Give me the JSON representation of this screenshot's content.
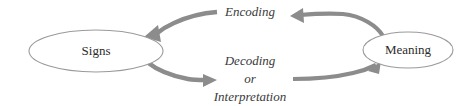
{
  "diagram": {
    "type": "cycle-diagram",
    "background_color": "#ffffff",
    "nodes": [
      {
        "id": "signs",
        "label": "Signs",
        "shape": "ellipse",
        "cx": 96,
        "cy": 51,
        "rx": 67,
        "ry": 21,
        "stroke_color": "#9a9a9a",
        "fill_color": "#ffffff",
        "text_color": "#2b2b2b"
      },
      {
        "id": "meaning",
        "label": "Meaning",
        "shape": "ellipse",
        "cx": 408,
        "cy": 50,
        "rx": 45,
        "ry": 18,
        "stroke_color": "#9a9a9a",
        "fill_color": "#ffffff",
        "text_color": "#2b2b2b"
      }
    ],
    "edges": [
      {
        "id": "encoding",
        "label": "Encoding",
        "from": "meaning",
        "to": "signs",
        "direction": "right-to-left",
        "label_x": 250,
        "label_y": 13,
        "arrow_color": "#8c8c8c"
      },
      {
        "id": "decoding",
        "label": "Decoding\nor\nInterpretation",
        "label_lines": [
          "Decoding",
          "or",
          "Interpretation"
        ],
        "from": "signs",
        "to": "meaning",
        "direction": "left-to-right",
        "label_x": 250,
        "label_y": 62,
        "line_spacing": 18,
        "arrow_color": "#8c8c8c"
      }
    ],
    "labels": {
      "signs": "Signs",
      "meaning": "Meaning",
      "encoding": "Encoding",
      "decoding": "Decoding",
      "or": "or",
      "interpretation": "Interpretation"
    }
  }
}
